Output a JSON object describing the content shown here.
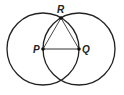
{
  "diagram": {
    "type": "geometric-construction",
    "stroke_color": "#222222",
    "background": "#ffffff",
    "points": [
      {
        "id": "P",
        "label": "P",
        "x": 43,
        "y": 49,
        "label_x": 33,
        "label_y": 53
      },
      {
        "id": "Q",
        "label": "Q",
        "x": 79,
        "y": 49,
        "label_x": 82,
        "label_y": 53
      },
      {
        "id": "R",
        "label": "R",
        "x": 61,
        "y": 18,
        "label_x": 57,
        "label_y": 13
      }
    ],
    "circles": [
      {
        "id": "circle-P",
        "center": "P",
        "cx": 43,
        "cy": 49,
        "r": 36
      },
      {
        "id": "circle-Q",
        "center": "Q",
        "cx": 79,
        "cy": 49,
        "r": 36
      }
    ],
    "segments": [
      {
        "id": "PQ",
        "from": "P",
        "to": "Q"
      },
      {
        "id": "PR",
        "from": "P",
        "to": "R"
      },
      {
        "id": "QR",
        "from": "Q",
        "to": "R"
      }
    ]
  }
}
